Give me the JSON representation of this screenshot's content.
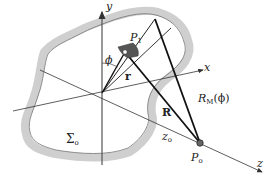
{
  "diagram": {
    "colors": {
      "surface_fill": "#cfcfcf",
      "surface_edge": "#555555",
      "axis": "#444444",
      "ray": "#111111",
      "patch": "#555555"
    },
    "labels": {
      "y_axis": "y",
      "x_axis": "x",
      "z_axis": "z",
      "phi": "ϕ",
      "p1_main": "P",
      "p1_sub": "1",
      "r_vec": "r",
      "R_vec": "R",
      "rm_main": "R",
      "rm_sub": "M",
      "rm_arg": "(ϕ)",
      "z0_main": "z",
      "z0_sub": "o",
      "p0_main": "P",
      "p0_sub": "o",
      "sigma_main": "Σ",
      "sigma_sub": "o"
    },
    "points": {
      "origin": [
        102,
        93
      ],
      "P1": [
        125,
        52
      ],
      "P0": [
        200,
        143
      ],
      "top_vertex": [
        155,
        19
      ]
    }
  }
}
